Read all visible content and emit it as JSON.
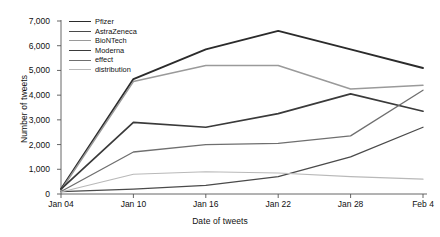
{
  "chart_data": {
    "type": "line",
    "title": "",
    "xlabel": "Date of tweets",
    "ylabel": "Number of tweets",
    "categories": [
      "Jan 04",
      "Jan 10",
      "Jan 16",
      "Jan 22",
      "Jan 28",
      "Feb 4"
    ],
    "ylim": [
      0,
      7000
    ],
    "ytick_values": [
      0,
      1000,
      2000,
      3000,
      4000,
      5000,
      6000,
      7000
    ],
    "ytick_labels": [
      "0",
      "1,000",
      "2,000",
      "3,000",
      "4,000",
      "5,000",
      "6,000",
      "7,000"
    ],
    "grid": false,
    "legend_position": "top-left-inside",
    "series": [
      {
        "name": "Pfizer",
        "color": "#2b2b2b",
        "width": 1.9,
        "values": [
          200,
          4650,
          5850,
          6600,
          5850,
          5100
        ]
      },
      {
        "name": "AstraZeneca",
        "color": "#4a4a4a",
        "width": 1.3,
        "values": [
          100,
          200,
          350,
          700,
          1500,
          2700
        ]
      },
      {
        "name": "BioNTech",
        "color": "#9a9a9a",
        "width": 1.5,
        "values": [
          150,
          4550,
          5200,
          5200,
          4250,
          4400
        ]
      },
      {
        "name": "Moderna",
        "color": "#3a3a3a",
        "width": 1.7,
        "values": [
          200,
          2900,
          2700,
          3250,
          4050,
          3350
        ]
      },
      {
        "name": "effect",
        "color": "#6f6f6f",
        "width": 1.3,
        "values": [
          100,
          1700,
          2000,
          2050,
          2350,
          4200
        ]
      },
      {
        "name": "distribution",
        "color": "#b9b9b9",
        "width": 1.2,
        "values": [
          80,
          800,
          900,
          850,
          700,
          600
        ]
      }
    ]
  },
  "axis": {
    "line_color": "#555555"
  }
}
